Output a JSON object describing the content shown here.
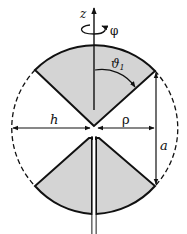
{
  "diagram": {
    "type": "biconical antenna",
    "labels": {
      "z_axis": "z",
      "phi": "φ",
      "theta": "ϑ",
      "theta_sub": "1",
      "h": "h",
      "rho": "ρ",
      "a": "a"
    },
    "colors": {
      "cone_fill": "#d4d4d4",
      "stroke": "#111111",
      "background": "#ffffff"
    }
  }
}
